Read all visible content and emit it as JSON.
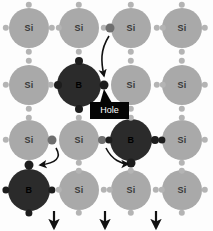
{
  "diagram": {
    "labels": {
      "silicon": "Si",
      "boron": "B",
      "hole": "Hole"
    },
    "colors": {
      "background": "#fdfdfd",
      "silicon_atom": "#a9a9a9",
      "boron_atom": "#2b2b2b",
      "silicon_text": "#3a3a3a",
      "boron_text": "#000000",
      "electron_light": "#b4b4b4",
      "electron_dark": "#1d1d1d",
      "electron_mid": "#6e6e6e",
      "hole_box": "#050505",
      "hole_text": "#ffffff",
      "arrow": "#111111"
    },
    "lattice": {
      "columns": 4,
      "rows": 4,
      "column_centers_px": [
        29,
        79,
        131,
        182
      ],
      "row_centers_px": [
        28,
        85,
        140,
        190
      ],
      "atom_radius_px": 20,
      "grid": [
        [
          "Si",
          "Si",
          "Si",
          "Si"
        ],
        [
          "Si",
          "B",
          "Si",
          "Si"
        ],
        [
          "Si",
          "Si",
          "B",
          "Si"
        ],
        [
          "B",
          "Si",
          "Si",
          "Si"
        ]
      ]
    },
    "atoms": [
      {
        "symbol": "Si",
        "type": "silicon",
        "cx": 29,
        "cy": 28,
        "r": 20
      },
      {
        "symbol": "Si",
        "type": "silicon",
        "cx": 79,
        "cy": 28,
        "r": 20
      },
      {
        "symbol": "Si",
        "type": "silicon",
        "cx": 131,
        "cy": 28,
        "r": 20
      },
      {
        "symbol": "Si",
        "type": "silicon",
        "cx": 182,
        "cy": 28,
        "r": 20
      },
      {
        "symbol": "Si",
        "type": "silicon",
        "cx": 29,
        "cy": 85,
        "r": 20
      },
      {
        "symbol": "B",
        "type": "boron",
        "cx": 79,
        "cy": 85,
        "r": 22
      },
      {
        "symbol": "Si",
        "type": "silicon",
        "cx": 131,
        "cy": 85,
        "r": 20
      },
      {
        "symbol": "Si",
        "type": "silicon",
        "cx": 182,
        "cy": 85,
        "r": 20
      },
      {
        "symbol": "Si",
        "type": "silicon",
        "cx": 29,
        "cy": 140,
        "r": 20
      },
      {
        "symbol": "Si",
        "type": "silicon",
        "cx": 79,
        "cy": 140,
        "r": 20
      },
      {
        "symbol": "B",
        "type": "boron",
        "cx": 131,
        "cy": 140,
        "r": 21
      },
      {
        "symbol": "Si",
        "type": "silicon",
        "cx": 182,
        "cy": 140,
        "r": 20
      },
      {
        "symbol": "B",
        "type": "boron",
        "cx": 29,
        "cy": 190,
        "r": 21
      },
      {
        "symbol": "Si",
        "type": "silicon",
        "cx": 79,
        "cy": 190,
        "r": 20
      },
      {
        "symbol": "Si",
        "type": "silicon",
        "cx": 131,
        "cy": 190,
        "r": 20
      },
      {
        "symbol": "Si",
        "type": "silicon",
        "cx": 182,
        "cy": 190,
        "r": 20
      }
    ],
    "electrons": [
      {
        "cx": 6,
        "cy": 28,
        "r": 3.2,
        "shade": "light"
      },
      {
        "cx": 52,
        "cy": 28,
        "r": 3.2,
        "shade": "light"
      },
      {
        "cx": 59,
        "cy": 28,
        "r": 3.2,
        "shade": "light"
      },
      {
        "cx": 104,
        "cy": 28,
        "r": 3.2,
        "shade": "light"
      },
      {
        "cx": 157,
        "cy": 28,
        "r": 3.2,
        "shade": "light"
      },
      {
        "cx": 163,
        "cy": 28,
        "r": 3.2,
        "shade": "light"
      },
      {
        "cx": 205,
        "cy": 28,
        "r": 3.2,
        "shade": "light"
      },
      {
        "cx": 29,
        "cy": 5,
        "r": 3.2,
        "shade": "light"
      },
      {
        "cx": 79,
        "cy": 5,
        "r": 3.2,
        "shade": "light"
      },
      {
        "cx": 131,
        "cy": 5,
        "r": 3.2,
        "shade": "light"
      },
      {
        "cx": 182,
        "cy": 5,
        "r": 3.2,
        "shade": "light"
      },
      {
        "cx": 29,
        "cy": 52,
        "r": 3.2,
        "shade": "light"
      },
      {
        "cx": 29,
        "cy": 61,
        "r": 3.2,
        "shade": "light"
      },
      {
        "cx": 79,
        "cy": 52,
        "r": 3.2,
        "shade": "light"
      },
      {
        "cx": 79,
        "cy": 61,
        "r": 4.0,
        "shade": "dark"
      },
      {
        "cx": 131,
        "cy": 52,
        "r": 3.2,
        "shade": "light"
      },
      {
        "cx": 131,
        "cy": 61,
        "r": 3.2,
        "shade": "light"
      },
      {
        "cx": 182,
        "cy": 52,
        "r": 3.2,
        "shade": "light"
      },
      {
        "cx": 182,
        "cy": 61,
        "r": 3.2,
        "shade": "light"
      },
      {
        "cx": 6,
        "cy": 85,
        "r": 3.2,
        "shade": "light"
      },
      {
        "cx": 51,
        "cy": 85,
        "r": 3.2,
        "shade": "light"
      },
      {
        "cx": 58,
        "cy": 85,
        "r": 4.0,
        "shade": "dark"
      },
      {
        "cx": 104,
        "cy": 85,
        "r": 4.5,
        "shade": "dark"
      },
      {
        "cx": 157,
        "cy": 85,
        "r": 3.2,
        "shade": "light"
      },
      {
        "cx": 163,
        "cy": 85,
        "r": 3.2,
        "shade": "light"
      },
      {
        "cx": 205,
        "cy": 85,
        "r": 3.2,
        "shade": "light"
      },
      {
        "cx": 79,
        "cy": 109,
        "r": 4.0,
        "shade": "dark"
      },
      {
        "cx": 79,
        "cy": 118,
        "r": 3.2,
        "shade": "light"
      },
      {
        "cx": 29,
        "cy": 109,
        "r": 3.2,
        "shade": "light"
      },
      {
        "cx": 29,
        "cy": 118,
        "r": 3.2,
        "shade": "light"
      },
      {
        "cx": 131,
        "cy": 109,
        "r": 3.2,
        "shade": "light"
      },
      {
        "cx": 131,
        "cy": 118,
        "r": 3.2,
        "shade": "light"
      },
      {
        "cx": 182,
        "cy": 109,
        "r": 3.2,
        "shade": "light"
      },
      {
        "cx": 182,
        "cy": 118,
        "r": 3.2,
        "shade": "light"
      },
      {
        "cx": 6,
        "cy": 140,
        "r": 3.2,
        "shade": "light"
      },
      {
        "cx": 52,
        "cy": 140,
        "r": 4.5,
        "shade": "mid"
      },
      {
        "cx": 102,
        "cy": 140,
        "r": 4.0,
        "shade": "mid"
      },
      {
        "cx": 109,
        "cy": 140,
        "r": 3.6,
        "shade": "dark"
      },
      {
        "cx": 155,
        "cy": 140,
        "r": 4.0,
        "shade": "dark"
      },
      {
        "cx": 162,
        "cy": 140,
        "r": 3.6,
        "shade": "dark"
      },
      {
        "cx": 205,
        "cy": 140,
        "r": 3.2,
        "shade": "light"
      },
      {
        "cx": 29,
        "cy": 165,
        "r": 4.5,
        "shade": "dark"
      },
      {
        "cx": 79,
        "cy": 163,
        "r": 3.2,
        "shade": "light"
      },
      {
        "cx": 79,
        "cy": 171,
        "r": 3.2,
        "shade": "light"
      },
      {
        "cx": 131,
        "cy": 163,
        "r": 4.5,
        "shade": "dark"
      },
      {
        "cx": 131,
        "cy": 171,
        "r": 3.2,
        "shade": "light"
      },
      {
        "cx": 182,
        "cy": 163,
        "r": 3.2,
        "shade": "light"
      },
      {
        "cx": 182,
        "cy": 171,
        "r": 3.2,
        "shade": "light"
      },
      {
        "cx": 6,
        "cy": 190,
        "r": 3.6,
        "shade": "dark"
      },
      {
        "cx": 52,
        "cy": 190,
        "r": 3.6,
        "shade": "dark"
      },
      {
        "cx": 59,
        "cy": 190,
        "r": 3.2,
        "shade": "light"
      },
      {
        "cx": 104,
        "cy": 190,
        "r": 3.2,
        "shade": "light"
      },
      {
        "cx": 110,
        "cy": 190,
        "r": 3.2,
        "shade": "light"
      },
      {
        "cx": 156,
        "cy": 190,
        "r": 3.2,
        "shade": "light"
      },
      {
        "cx": 162,
        "cy": 190,
        "r": 3.2,
        "shade": "light"
      },
      {
        "cx": 205,
        "cy": 190,
        "r": 3.2,
        "shade": "light"
      },
      {
        "cx": 29,
        "cy": 213,
        "r": 3.6,
        "shade": "dark"
      },
      {
        "cx": 79,
        "cy": 213,
        "r": 3.2,
        "shade": "light"
      },
      {
        "cx": 131,
        "cy": 213,
        "r": 3.2,
        "shade": "light"
      },
      {
        "cx": 182,
        "cy": 213,
        "r": 3.2,
        "shade": "light"
      },
      {
        "cx": 110,
        "cy": 28,
        "r": 4.5,
        "shade": "mid"
      }
    ],
    "arrows": [
      {
        "name": "electron-jump-top",
        "path": "M 109 36 C 100 50 101 62 104 76"
      },
      {
        "name": "electron-jump-left",
        "path": "M 56 148 C 62 158 56 163 40 165"
      },
      {
        "name": "electron-jump-right",
        "path": "M 106 148 C 112 160 122 164 128 164"
      }
    ],
    "field_arrows": [
      {
        "name": "field-arrow-1",
        "x": 54,
        "y_top": 211,
        "y_bottom": 228
      },
      {
        "name": "field-arrow-2",
        "x": 105,
        "y_top": 211,
        "y_bottom": 228
      },
      {
        "name": "field-arrow-3",
        "x": 156,
        "y_top": 211,
        "y_bottom": 228
      }
    ],
    "hole_callout": {
      "box": {
        "x": 90,
        "y": 102,
        "w": 39,
        "h": 17
      },
      "pointer": "M 104 89 L 112 103 L 100 103 Z"
    }
  }
}
